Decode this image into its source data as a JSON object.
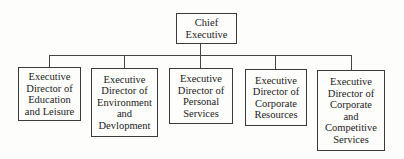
{
  "chart": {
    "root": {
      "label": "Chief\nExecutive"
    },
    "children": [
      {
        "label": "Executive\nDirector of\nEducation\nand Leisure"
      },
      {
        "label": "Executive\nDirector of\nEnvironment\nand\nDevlopment"
      },
      {
        "label": "Executive\nDirector of\nPersonal\nServices"
      },
      {
        "label": "Executive\nDirector of\nCorporate\nResources"
      },
      {
        "label": "Executive\nDirector of\nCorporate\nand\nCompetitive\nServices"
      }
    ]
  }
}
